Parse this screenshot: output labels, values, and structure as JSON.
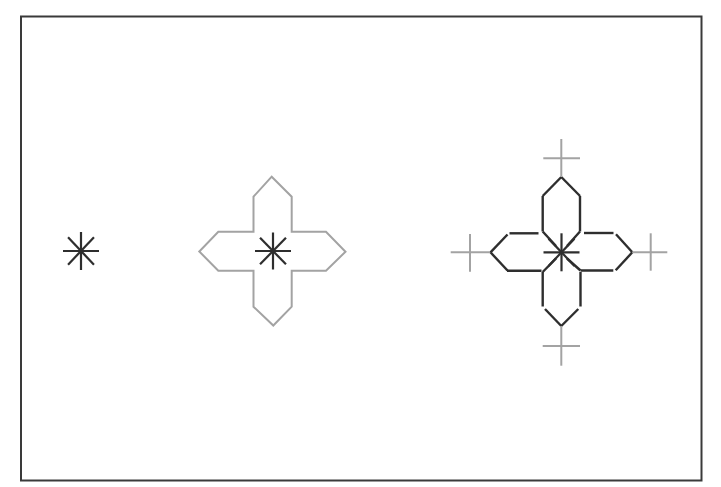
{
  "canvas": {
    "width": 721,
    "height": 487,
    "background": "#ffffff"
  },
  "colors": {
    "frame": "#3a3a3a",
    "dark": "#2e2e2e",
    "gray": "#a3a3a3"
  },
  "frame": {
    "x": 21,
    "y": 16.5,
    "width": 680.5,
    "height": 464
  },
  "figures": [
    {
      "id": "single-point",
      "center": [
        81,
        251
      ],
      "asterisk": {
        "rx": 18,
        "ry": 19,
        "color": "dark"
      }
    },
    {
      "id": "point-with-neighborhood",
      "center": [
        273,
        251
      ],
      "asterisk": {
        "rx": 18,
        "ry": 18.5,
        "color": "dark"
      },
      "outline": {
        "color": "gray",
        "points": [
          [
            253.5,
            231.7
          ],
          [
            253.5,
            196.7
          ],
          [
            271.7,
            176.7
          ],
          [
            291.7,
            196.7
          ],
          [
            291.7,
            231.7
          ],
          [
            326,
            231.7
          ],
          [
            345.5,
            251.7
          ],
          [
            326,
            270.7
          ],
          [
            291.7,
            270.7
          ],
          [
            291.7,
            306.7
          ],
          [
            273.3,
            325.5
          ],
          [
            253.5,
            306.7
          ],
          [
            253.5,
            270.7
          ],
          [
            218.3,
            270.7
          ],
          [
            199.3,
            251.5
          ],
          [
            218.3,
            231.7
          ]
        ]
      }
    },
    {
      "id": "point-with-neighborhood-and-crosses",
      "center": [
        561.5,
        252.3
      ],
      "asterisk": {
        "rx": 18,
        "ry": 19,
        "color": "dark"
      },
      "segments": {
        "color": "dark",
        "lines": [
          [
            [
              542.7,
              231.5
            ],
            [
              542.7,
              196
            ]
          ],
          [
            [
              542.7,
              196
            ],
            [
              561.3,
              177
            ]
          ],
          [
            [
              561.3,
              177
            ],
            [
              580,
              196
            ]
          ],
          [
            [
              580,
              196
            ],
            [
              580,
              231.5
            ]
          ],
          [
            [
              509.5,
              233.3
            ],
            [
              538.5,
              233.3
            ]
          ],
          [
            [
              507.5,
              234.5
            ],
            [
              490.5,
              252.3
            ]
          ],
          [
            [
              490.5,
              252.3
            ],
            [
              507.5,
              270.5
            ]
          ],
          [
            [
              507,
              270.7
            ],
            [
              541.5,
              270.7
            ]
          ],
          [
            [
              584,
              233
            ],
            [
              613.5,
              233
            ]
          ],
          [
            [
              616,
              234.3
            ],
            [
              632.3,
              252.3
            ]
          ],
          [
            [
              632.3,
              252.3
            ],
            [
              615.7,
              270.3
            ]
          ],
          [
            [
              580.5,
              270.5
            ],
            [
              613.3,
              270.5
            ]
          ],
          [
            [
              542.7,
              272
            ],
            [
              542.7,
              306.5
            ]
          ],
          [
            [
              545,
              309
            ],
            [
              561.3,
              326
            ]
          ],
          [
            [
              561.3,
              326
            ],
            [
              578.3,
              309
            ]
          ],
          [
            [
              580.5,
              272
            ],
            [
              580.5,
              306.5
            ]
          ],
          [
            [
              542.7,
              231.5
            ],
            [
              556,
              246
            ]
          ],
          [
            [
              580,
              231.5
            ],
            [
              567,
              246
            ]
          ],
          [
            [
              542.7,
              272
            ],
            [
              556,
              258.5
            ]
          ],
          [
            [
              580.5,
              270.5
            ],
            [
              567,
              258.5
            ]
          ]
        ]
      },
      "crosses": {
        "color": "gray",
        "items": [
          {
            "name": "top",
            "center": [
              561.3,
              158.3
            ],
            "hx": [
              543.3,
              580
            ],
            "vy": [
              139,
              176.7
            ]
          },
          {
            "name": "left",
            "center": [
              470,
              252.3
            ],
            "hx": [
              450.7,
              490
            ],
            "vy": [
              234,
              271.7
            ]
          },
          {
            "name": "right",
            "center": [
              650.7,
              252.3
            ],
            "hx": [
              632.3,
              667.3
            ],
            "vy": [
              233.3,
              270.7
            ]
          },
          {
            "name": "bottom",
            "center": [
              561.3,
              346
            ],
            "hx": [
              542.7,
              580
            ],
            "vy": [
              326,
              365.7
            ]
          }
        ]
      }
    }
  ]
}
